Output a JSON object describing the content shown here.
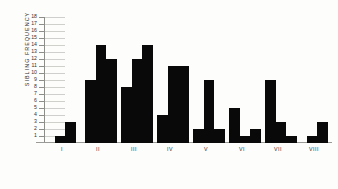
{
  "chart_data": {
    "type": "bar",
    "title": "",
    "xlabel": "",
    "ylabel": "SIBLING FREQUENCY",
    "ylim": [
      0,
      18
    ],
    "ytick_labels": [
      "18",
      "17",
      "16",
      "15",
      "14",
      "13",
      "12",
      "11",
      "10",
      "9",
      "8",
      "7",
      "6",
      "5",
      "4",
      "3",
      "2",
      "1"
    ],
    "ytick_values": [
      18,
      17,
      16,
      15,
      14,
      13,
      12,
      11,
      10,
      9,
      8,
      7,
      6,
      5,
      4,
      3,
      2,
      1
    ],
    "grid": true,
    "legend": "none",
    "categories": [
      "I",
      "II",
      "III",
      "IV",
      "V",
      "VI",
      "VII",
      "VIII"
    ],
    "groups": [
      {
        "label": "I",
        "values": [
          1,
          3
        ]
      },
      {
        "label": "II",
        "values": [
          9,
          14,
          12
        ]
      },
      {
        "label": "III",
        "values": [
          8,
          12,
          14
        ]
      },
      {
        "label": "IV",
        "values": [
          4,
          11,
          11
        ]
      },
      {
        "label": "V",
        "values": [
          2,
          9,
          2
        ]
      },
      {
        "label": "VI",
        "values": [
          5,
          1,
          2
        ]
      },
      {
        "label": "VII",
        "values": [
          9,
          3,
          1
        ]
      },
      {
        "label": "VIII",
        "values": [
          1,
          3
        ]
      }
    ],
    "bar_color": "#090909",
    "axis_color": "#8d8d8a",
    "background": "#fdfdfc"
  }
}
